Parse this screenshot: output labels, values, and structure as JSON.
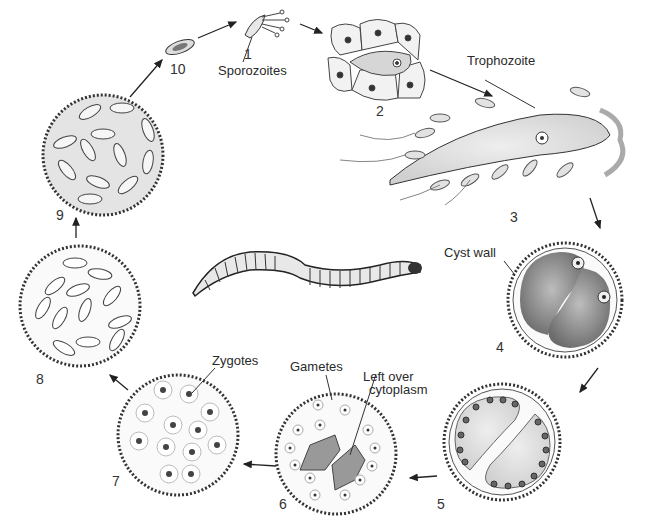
{
  "diagram": {
    "type": "life-cycle",
    "stages": [
      {
        "number": "1",
        "label": "Sporozoites"
      },
      {
        "number": "2",
        "label": ""
      },
      {
        "number": "3",
        "label": "Trophozoite"
      },
      {
        "number": "4",
        "label": "Cyst wall"
      },
      {
        "number": "5",
        "label": ""
      },
      {
        "number": "6",
        "label": "Gametes",
        "extra_label": "Left over cytoplasm"
      },
      {
        "number": "7",
        "label": "Zygotes"
      },
      {
        "number": "8",
        "label": ""
      },
      {
        "number": "9",
        "label": ""
      },
      {
        "number": "10",
        "label": ""
      }
    ],
    "labels": {
      "sporozoites": "Sporozoites",
      "trophozoite": "Trophozoite",
      "cyst_wall": "Cyst wall",
      "gametes": "Gametes",
      "left_over_line1": "Left over",
      "left_over_line2": "cytoplasm",
      "zygotes": "Zygotes"
    },
    "center_image": "earthworm",
    "ink_color": "#2b2b2b",
    "fill_color": "#d9d9d9"
  }
}
